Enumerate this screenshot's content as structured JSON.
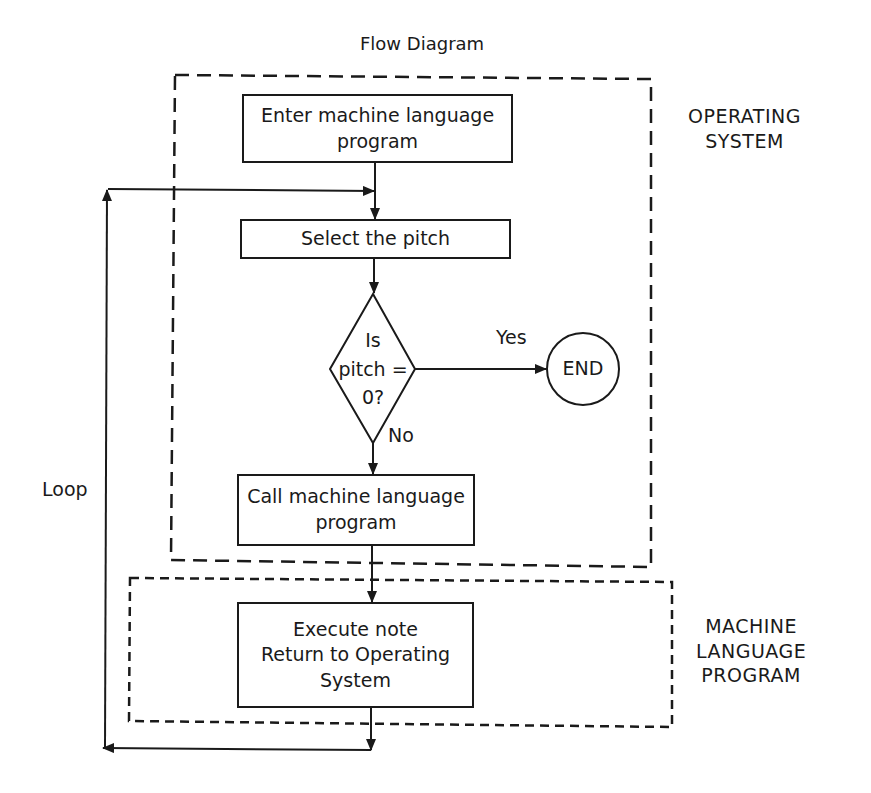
{
  "title": "Flow Diagram",
  "regions": {
    "operating_system": {
      "label_line1": "OPERATING",
      "label_line2": "SYSTEM"
    },
    "machine_language": {
      "label_line1": "MACHINE",
      "label_line2": "LANGUAGE",
      "label_line3": "PROGRAM"
    }
  },
  "nodes": {
    "enter": {
      "line1": "Enter machine language",
      "line2": "program"
    },
    "select": {
      "line1": "Select the pitch"
    },
    "decision": {
      "line1": "Is",
      "line2": "pitch =",
      "line3": "0?"
    },
    "end": {
      "line1": "END"
    },
    "call": {
      "line1": "Call machine language",
      "line2": "program"
    },
    "execute": {
      "line1": "Execute note",
      "line2": "Return to Operating",
      "line3": "System"
    }
  },
  "edges": {
    "yes_label": "Yes",
    "no_label": "No",
    "loop_label": "Loop"
  },
  "colors": {
    "ink": "#1a1a1a",
    "background": "#ffffff"
  }
}
